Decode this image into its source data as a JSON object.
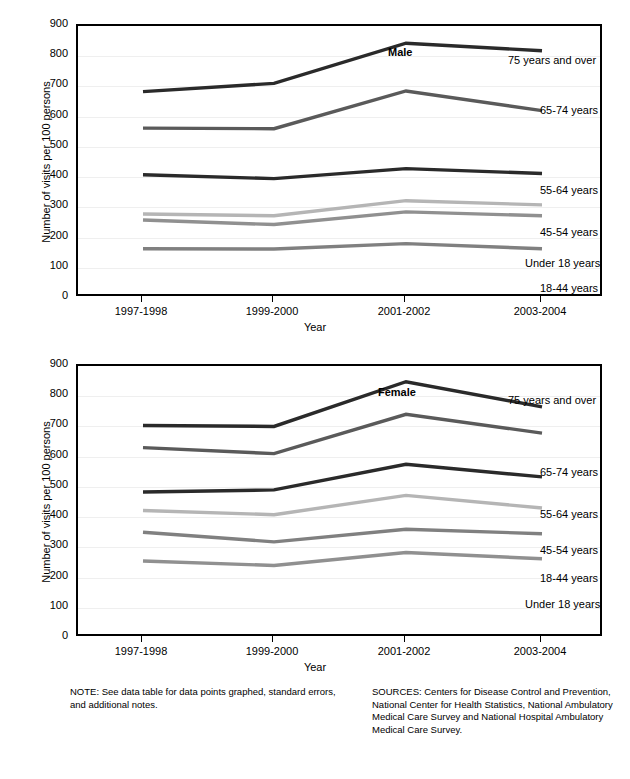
{
  "axis": {
    "y_title": "Number of visits per 100 persons",
    "x_title": "Year",
    "y_ticks": [
      "900",
      "800",
      "700",
      "600",
      "500",
      "400",
      "300",
      "200",
      "100",
      "0"
    ],
    "x_ticks": [
      "1997-1998",
      "1999-2000",
      "2001-2002",
      "2003-2004"
    ]
  },
  "panels": {
    "male": {
      "title": "Male"
    },
    "female": {
      "title": "Female"
    }
  },
  "series_labels": {
    "over75": "75 years and over",
    "a65_74": "65-74 years",
    "a55_64": "55-64 years",
    "a45_54": "45-54 years",
    "a18_44": "18-44 years",
    "under18": "Under 18 years"
  },
  "footnotes": {
    "note": "NOTE: See data table for data points graphed, standard errors, and additional notes.",
    "sources": "SOURCES: Centers for Disease Control and Prevention, National Center for Health Statistics, National Ambulatory Medical Care Survey and National Hospital Ambulatory Medical Care Survey."
  },
  "colors": {
    "over75": "#2a2a2a",
    "a65_74": "#5a5a5a",
    "a55_64": "#2a2a2a",
    "a45_54": "#b5b5b5",
    "a18_44": "#808080",
    "under18": "#909090",
    "grid": "#efefef",
    "frame": "#000000"
  },
  "chart_data": [
    {
      "type": "line",
      "title": "Male",
      "xlabel": "Year",
      "ylabel": "Number of visits per 100 persons",
      "ylim": [
        0,
        900
      ],
      "ytick_step": 100,
      "grid": true,
      "legend": "inline-right-of-line",
      "categories": [
        "1997-1998",
        "1999-2000",
        "2001-2002",
        "2003-2004"
      ],
      "series": [
        {
          "name": "75 years and over",
          "values": [
            683,
            710,
            843,
            818
          ],
          "color": "#2a2a2a"
        },
        {
          "name": "65-74 years",
          "values": [
            562,
            560,
            685,
            620
          ],
          "color": "#5a5a5a"
        },
        {
          "name": "55-64 years",
          "values": [
            408,
            395,
            428,
            412
          ],
          "color": "#2a2a2a"
        },
        {
          "name": "45-54 years",
          "values": [
            278,
            272,
            322,
            308
          ],
          "color": "#b5b5b5"
        },
        {
          "name": "Under 18 years",
          "values": [
            258,
            243,
            285,
            272
          ],
          "color": "#909090"
        },
        {
          "name": "18-44 years",
          "values": [
            163,
            162,
            180,
            163
          ],
          "color": "#808080"
        }
      ]
    },
    {
      "type": "line",
      "title": "Female",
      "xlabel": "Year",
      "ylabel": "Number of visits per 100 persons",
      "ylim": [
        0,
        900
      ],
      "ytick_step": 100,
      "grid": true,
      "legend": "inline-right-of-line",
      "categories": [
        "1997-1998",
        "1999-2000",
        "2001-2002",
        "2003-2004"
      ],
      "series": [
        {
          "name": "75 years and over",
          "values": [
            703,
            700,
            848,
            765
          ],
          "color": "#2a2a2a"
        },
        {
          "name": "65-74 years",
          "values": [
            630,
            610,
            740,
            678
          ],
          "color": "#5a5a5a"
        },
        {
          "name": "55-64 years",
          "values": [
            483,
            490,
            575,
            533
          ],
          "color": "#2a2a2a"
        },
        {
          "name": "45-54 years",
          "values": [
            422,
            408,
            472,
            430
          ],
          "color": "#b5b5b5"
        },
        {
          "name": "18-44 years",
          "values": [
            350,
            318,
            360,
            345
          ],
          "color": "#808080"
        },
        {
          "name": "Under 18 years",
          "values": [
            255,
            240,
            283,
            262
          ],
          "color": "#909090"
        }
      ]
    }
  ],
  "label_positions": {
    "male": [
      {
        "key": "over75",
        "x": 430,
        "y": 28
      },
      {
        "key": "a65_74",
        "x": 462,
        "y": 78
      },
      {
        "key": "a55_64",
        "x": 462,
        "y": 158
      },
      {
        "key": "a45_54",
        "x": 462,
        "y": 200
      },
      {
        "key": "under18",
        "x": 447,
        "y": 231
      },
      {
        "key": "a18_44",
        "x": 462,
        "y": 256
      }
    ],
    "female": [
      {
        "key": "over75",
        "x": 430,
        "y": 28
      },
      {
        "key": "a65_74",
        "x": 462,
        "y": 100
      },
      {
        "key": "a55_64",
        "x": 462,
        "y": 142
      },
      {
        "key": "a45_54",
        "x": 462,
        "y": 178
      },
      {
        "key": "a18_44",
        "x": 462,
        "y": 206
      },
      {
        "key": "under18",
        "x": 447,
        "y": 232
      }
    ]
  },
  "sex_title_positions": {
    "male": {
      "x": 310,
      "y": 20
    },
    "female": {
      "x": 300,
      "y": 20
    }
  }
}
